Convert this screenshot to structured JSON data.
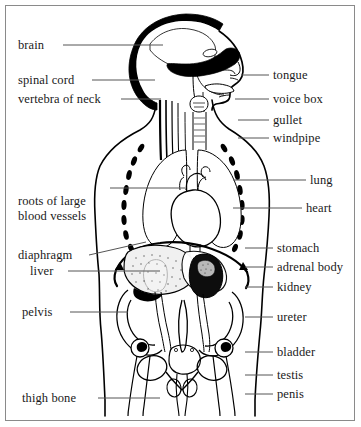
{
  "figure": {
    "border_color": "#8a8a8a",
    "background_color": "#ffffff",
    "ink_color": "#000000",
    "leader_line_color": "#555555"
  },
  "labels_left": [
    {
      "id": "brain",
      "text": "brain",
      "x": 18,
      "y": 38,
      "leader": {
        "x1": 63,
        "y1": 45,
        "x2": 163,
        "y2": 45
      }
    },
    {
      "id": "spinal-cord",
      "text": "spinal cord",
      "x": 18,
      "y": 73,
      "leader": {
        "x1": 92,
        "y1": 80,
        "x2": 155,
        "y2": 80
      }
    },
    {
      "id": "vertebra-of-neck",
      "text": "vertebra of neck",
      "x": 18,
      "y": 92,
      "leader": {
        "x1": 121,
        "y1": 99,
        "x2": 161,
        "y2": 99
      }
    },
    {
      "id": "roots-of-large-blood-vessels",
      "text": "roots of large blood vessels",
      "x": 18,
      "y": 194,
      "leader": {
        "x1": 110,
        "y1": 188,
        "x2": 185,
        "y2": 188
      }
    },
    {
      "id": "diaphragm",
      "text": "diaphragm",
      "x": 18,
      "y": 248,
      "leader": {
        "x1": 89,
        "y1": 255,
        "x2": 146,
        "y2": 242
      }
    },
    {
      "id": "liver",
      "text": "liver",
      "x": 30,
      "y": 264,
      "leader": {
        "x1": 68,
        "y1": 271,
        "x2": 160,
        "y2": 271
      }
    },
    {
      "id": "pelvis",
      "text": "pelvis",
      "x": 22,
      "y": 305,
      "leader": {
        "x1": 70,
        "y1": 312,
        "x2": 128,
        "y2": 312
      }
    },
    {
      "id": "thigh-bone",
      "text": "thigh bone",
      "x": 22,
      "y": 391,
      "leader": {
        "x1": 98,
        "y1": 398,
        "x2": 160,
        "y2": 398
      }
    }
  ],
  "labels_right": [
    {
      "id": "tongue",
      "text": "tongue",
      "x": 273,
      "y": 68,
      "leader": {
        "x1": 241,
        "y1": 75,
        "x2": 269,
        "y2": 75
      }
    },
    {
      "id": "voice-box",
      "text": "voice box",
      "x": 273,
      "y": 92,
      "leader": {
        "x1": 235,
        "y1": 99,
        "x2": 269,
        "y2": 99
      }
    },
    {
      "id": "gullet",
      "text": "gullet",
      "x": 273,
      "y": 113,
      "leader": {
        "x1": 238,
        "y1": 120,
        "x2": 269,
        "y2": 120
      }
    },
    {
      "id": "windpipe",
      "text": "windpipe",
      "x": 273,
      "y": 131,
      "leader": {
        "x1": 238,
        "y1": 138,
        "x2": 269,
        "y2": 138
      }
    },
    {
      "id": "lung",
      "text": "lung",
      "x": 310,
      "y": 173,
      "leader": {
        "x1": 233,
        "y1": 180,
        "x2": 306,
        "y2": 180
      }
    },
    {
      "id": "heart",
      "text": "heart",
      "x": 306,
      "y": 201,
      "leader": {
        "x1": 233,
        "y1": 208,
        "x2": 302,
        "y2": 208
      }
    },
    {
      "id": "stomach",
      "text": "stomach",
      "x": 277,
      "y": 241,
      "leader": {
        "x1": 245,
        "y1": 248,
        "x2": 273,
        "y2": 248
      }
    },
    {
      "id": "adrenal-body",
      "text": "adrenal body",
      "x": 277,
      "y": 260,
      "leader": {
        "x1": 245,
        "y1": 267,
        "x2": 273,
        "y2": 267
      }
    },
    {
      "id": "kidney",
      "text": "kidney",
      "x": 277,
      "y": 280,
      "leader": {
        "x1": 245,
        "y1": 287,
        "x2": 273,
        "y2": 287
      }
    },
    {
      "id": "ureter",
      "text": "ureter",
      "x": 277,
      "y": 310,
      "leader": {
        "x1": 245,
        "y1": 317,
        "x2": 273,
        "y2": 317
      }
    },
    {
      "id": "bladder",
      "text": "bladder",
      "x": 277,
      "y": 345,
      "leader": {
        "x1": 245,
        "y1": 352,
        "x2": 273,
        "y2": 352
      }
    },
    {
      "id": "testis",
      "text": "testis",
      "x": 277,
      "y": 368,
      "leader": {
        "x1": 245,
        "y1": 375,
        "x2": 273,
        "y2": 375
      }
    },
    {
      "id": "penis",
      "text": "penis",
      "x": 277,
      "y": 387,
      "leader": {
        "x1": 245,
        "y1": 394,
        "x2": 273,
        "y2": 394
      }
    }
  ]
}
